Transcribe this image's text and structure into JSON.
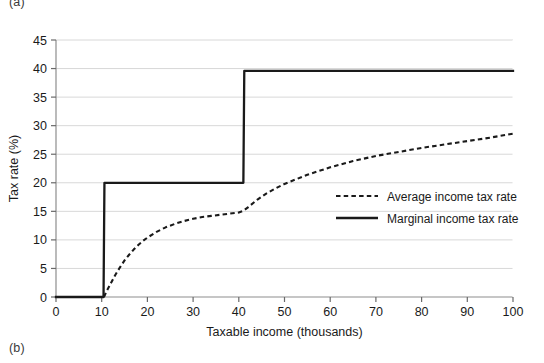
{
  "figure": {
    "panel_a_label": "(a)",
    "panel_b_label": "(b)"
  },
  "chart_data": {
    "type": "line",
    "title": "",
    "xlabel": "Taxable income (thousands)",
    "ylabel": "Tax rate (%)",
    "xlim": [
      0,
      100
    ],
    "ylim": [
      0,
      45
    ],
    "xticks": [
      0,
      10,
      20,
      30,
      40,
      50,
      60,
      70,
      80,
      90,
      100
    ],
    "yticks": [
      0,
      5,
      10,
      15,
      20,
      25,
      30,
      35,
      40,
      45
    ],
    "xtick_labels": [
      "0",
      "10",
      "20",
      "30",
      "40",
      "50",
      "60",
      "70",
      "80",
      "90",
      "100"
    ],
    "ytick_labels": [
      "0",
      "5",
      "10",
      "15",
      "20",
      "25",
      "30",
      "35",
      "40",
      "45"
    ],
    "grid": "horizontal",
    "grid_color": "#d8d8d8",
    "legend_position": "center-right",
    "series": [
      {
        "name": "Average income tax rate",
        "style": "dashed",
        "color": "#1a1a1a",
        "x": [
          10.5,
          11,
          12,
          13,
          14,
          15,
          16,
          17,
          18,
          19,
          20,
          22,
          24,
          26,
          28,
          30,
          32,
          34,
          36,
          38,
          40,
          41,
          42,
          44,
          46,
          48,
          50,
          55,
          60,
          65,
          70,
          75,
          80,
          85,
          90,
          95,
          100
        ],
        "values": [
          0,
          0.9,
          2.4,
          3.9,
          5.2,
          6.4,
          7.4,
          8.3,
          9.1,
          9.8,
          10.4,
          11.4,
          12.2,
          12.8,
          13.3,
          13.7,
          14.0,
          14.2,
          14.4,
          14.6,
          14.8,
          15.1,
          15.7,
          17.0,
          18.1,
          19.0,
          19.8,
          21.4,
          22.7,
          23.8,
          24.7,
          25.4,
          26.1,
          26.7,
          27.3,
          27.9,
          28.6
        ]
      },
      {
        "name": "Marginal income tax rate",
        "style": "solid",
        "color": "#1a1a1a",
        "x": [
          0,
          10.4,
          10.6,
          41.0,
          41.2,
          100
        ],
        "values": [
          0,
          0,
          20,
          20,
          39.6,
          39.6
        ]
      }
    ],
    "legend": [
      {
        "label": "Average income tax rate",
        "style": "dashed"
      },
      {
        "label": "Marginal income tax rate",
        "style": "solid"
      }
    ]
  }
}
